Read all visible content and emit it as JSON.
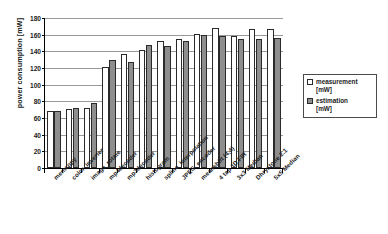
{
  "chart_data": {
    "type": "bar",
    "title": "",
    "xlabel": "",
    "ylabel": "power consumption [mW]",
    "ylim": [
      0,
      180
    ],
    "ytick_step": 20,
    "yticks": [
      0,
      20,
      40,
      60,
      80,
      100,
      120,
      140,
      160,
      180
    ],
    "grid": true,
    "legend_position": "right",
    "categories": [
      "memcopy",
      "color_inverter",
      "image_rotate",
      "mp4decoder",
      "mp3decoder",
      "histogram",
      "spline_interpolation",
      "JPEG_encoder",
      "meanshift (4,4)",
      "4 tap 1D FIR",
      "3x3 Median",
      "Dhrystone 2.1",
      "5x5 Median"
    ],
    "series": [
      {
        "name": "measurement [mW]",
        "label": "measurement",
        "unit": "[mW]",
        "color": "#ffffff",
        "edgecolor": "#2a2a2a",
        "values": [
          68,
          71,
          72,
          121,
          137,
          142,
          152,
          155,
          161,
          168,
          158,
          167,
          167
        ]
      },
      {
        "name": "estimation [mW]",
        "label": "estimation",
        "unit": "[mW]",
        "color": "#8e8e8e",
        "edgecolor": "#2a2a2a",
        "values": [
          69,
          72,
          78,
          130,
          127,
          148,
          147,
          153,
          160,
          158,
          155,
          155,
          156
        ]
      }
    ]
  }
}
